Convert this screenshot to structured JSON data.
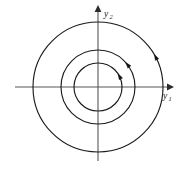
{
  "figure": {
    "name": "phase-portrait-concentric-circles",
    "background_color": "#ffffff",
    "width": 180,
    "height": 169
  },
  "axes": {
    "origin": {
      "x": 98,
      "y": 87
    },
    "horizontal": {
      "label": "y",
      "subscript": "1",
      "label_x": 165,
      "label_y": 97,
      "start_x": 15,
      "end_x": 167,
      "y": 87,
      "color": "#56565a",
      "arrow": "right-arrowhead"
    },
    "vertical": {
      "label": "y",
      "subscript": "2",
      "label_x": 106,
      "label_y": 16,
      "start_y": 161,
      "end_y": 12,
      "x": 98,
      "color": "#56565a",
      "arrow": "up-arrowhead"
    }
  },
  "chart_data": {
    "type": "scatter",
    "title": "",
    "xlabel": "y1",
    "ylabel": "y2",
    "xlim": [
      -65,
      65
    ],
    "ylim": [
      -65,
      65
    ],
    "grid": false,
    "legend": false,
    "center": [
      0,
      0
    ],
    "curve_family": "concentric circles (center equilibrium)",
    "flow_direction": "counterclockwise",
    "curves": [
      {
        "name": "inner-orbit",
        "radius": 24,
        "stroke": "#1b1b1f",
        "arrow_angle_deg": 28
      },
      {
        "name": "middle-orbit",
        "radius": 37,
        "stroke": "#1b1b1f",
        "arrow_angle_deg": 38
      },
      {
        "name": "outer-orbit",
        "radius": 65,
        "stroke": "#1b1b1f",
        "arrow_angle_deg": 28
      }
    ]
  },
  "colors": {
    "curve": "#1b1b1f",
    "axis": "#56565a",
    "arrow": "#121216",
    "background": "#ffffff"
  }
}
